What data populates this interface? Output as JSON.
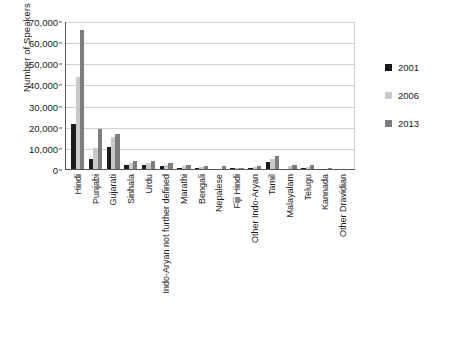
{
  "chart_data": {
    "type": "bar",
    "title": "",
    "xlabel": "",
    "ylabel": "Number of Speakers",
    "ylim": [
      0,
      70000
    ],
    "ytick_labels": [
      "70,000",
      "60,000",
      "50,000",
      "40,000",
      "30,000",
      "20,000",
      "10,000",
      "0"
    ],
    "ytick_values": [
      70000,
      60000,
      50000,
      40000,
      30000,
      20000,
      10000,
      0
    ],
    "grid": true,
    "legend_position": "right",
    "categories": [
      "Hindi",
      "Punjabi",
      "Gujarati",
      "Sinhala",
      "Urdu",
      "Indo-Aryan not further defined",
      "Marathi",
      "Bengali",
      "Nepalese",
      "Fiji Hindi",
      "Other Indo-Aryan",
      "Tamil",
      "Malayalam",
      "Telugu",
      "Kannada",
      "Other Dravidian"
    ],
    "series": [
      {
        "name": "2001",
        "color": "#1a1a1a",
        "values": [
          22000,
          5000,
          10800,
          2500,
          2400,
          1800,
          1100,
          900,
          500,
          900,
          1000,
          4000,
          400,
          1000,
          400,
          200
        ]
      },
      {
        "name": "2006",
        "color": "#c9c9c9",
        "values": [
          44000,
          10500,
          15500,
          3200,
          3300,
          2600,
          1700,
          1300,
          700,
          1000,
          1400,
          5300,
          1700,
          1400,
          700,
          300
        ]
      },
      {
        "name": "2013",
        "color": "#7d7d7d",
        "values": [
          66000,
          19500,
          17000,
          4200,
          4200,
          3200,
          2600,
          1700,
          1900,
          900,
          1800,
          6700,
          2400,
          2200,
          1100,
          400
        ]
      }
    ]
  },
  "legend": {
    "items": [
      {
        "label": "2001",
        "color": "#1a1a1a"
      },
      {
        "label": "2006",
        "color": "#c9c9c9"
      },
      {
        "label": "2013",
        "color": "#7d7d7d"
      }
    ]
  }
}
